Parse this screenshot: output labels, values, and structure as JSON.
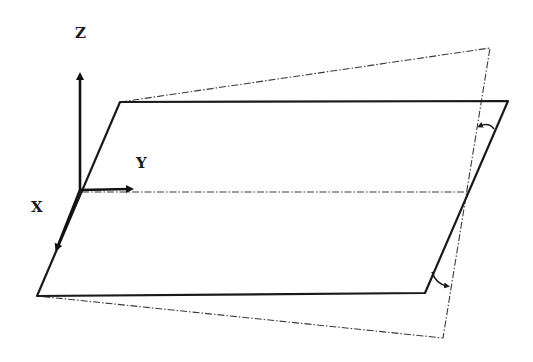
{
  "diagram": {
    "type": "coordinate-plane-rotation",
    "axes": {
      "z_label": "Z",
      "y_label": "Y",
      "x_label": "X"
    },
    "elements": [
      {
        "name": "reference-plane",
        "style": "solid",
        "description": "horizontal parallelogram plane"
      },
      {
        "name": "tilted-plane",
        "style": "dash-dot",
        "description": "plane rotated about the Y-parallel midline"
      },
      {
        "name": "rotation-axis",
        "style": "dash-dot",
        "description": "midline parallel to Y axis"
      },
      {
        "name": "angle-arrow-top",
        "description": "rotation angle indicator at top right edge"
      },
      {
        "name": "angle-arrow-bottom",
        "description": "rotation angle indicator at bottom right edge"
      }
    ],
    "colors": {
      "line": "#1a1a1a",
      "background": "#ffffff"
    }
  }
}
